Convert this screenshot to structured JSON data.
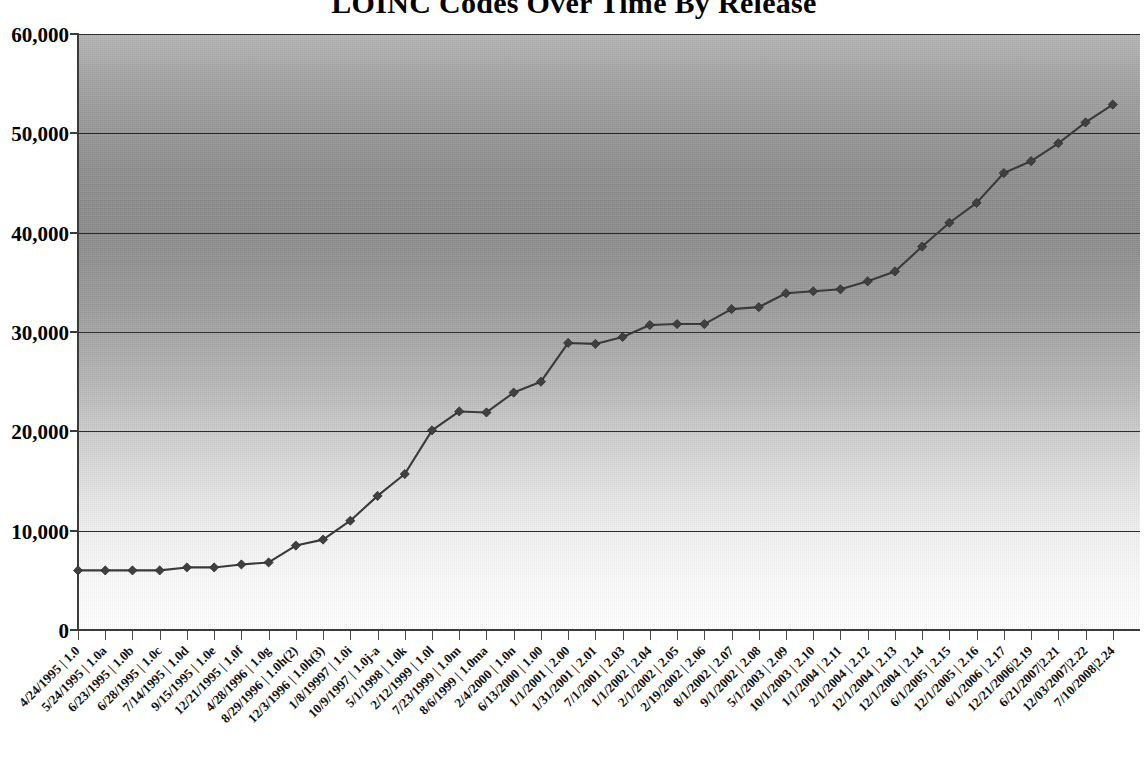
{
  "chart_data": {
    "type": "line",
    "title": "LOINC Codes Over Time By Release",
    "xlabel": "",
    "ylabel": "",
    "ylim": [
      0,
      60000
    ],
    "ytick_labels": [
      "0",
      "10,000",
      "20,000",
      "30,000",
      "40,000",
      "50,000",
      "60,000"
    ],
    "ytick_values": [
      0,
      10000,
      20000,
      30000,
      40000,
      50000,
      60000
    ],
    "grid": true,
    "legend": "none",
    "series_name": "LOINC Codes",
    "marker": "diamond",
    "line_color": "#3a3a3a",
    "marker_color": "#404040",
    "plot_gradient_top": "#8e8e8e",
    "plot_gradient_bottom": "#ffffff",
    "categories": [
      "4/24/1995 | 1.0",
      "5/24/1995 | 1.0a",
      "6/23/1995 | 1.0b",
      "6/28/1995 | 1.0c",
      "7/14/1995 | 1.0d",
      "9/15/1995 | 1.0e",
      "12/21/1995 | 1.0f",
      "4/28/1996 | 1.0g",
      "8/29/1996 | 1.0h(2)",
      "12/3/1996 | 1.0h(3)",
      "1/8/19997 | 1.0i",
      "10/9/1997 | 1.0j-a",
      "5/1/1998 | 1.0k",
      "2/12/1999 | 1.0l",
      "7/23/1999 | 1.0m",
      "8/6/1999 | 1.0ma",
      "2/4/2000 | 1.0n",
      "6/13/2000 | 1.00",
      "1/1/2001 | 2.00",
      "1/31/2001 | 2.01",
      "7/1/2001 | 2.03",
      "1/1/2002 | 2.04",
      "2/1/2002 | 2.05",
      "2/19/2002 | 2.06",
      "8/1/2002 | 2.07",
      "9/1/2002 | 2.08",
      "5/1/2003 | 2.09",
      "10/1/2003 | 2.10",
      "1/1/2004 | 2.11",
      "2/1/2004 | 2.12",
      "12/1/2004 | 2.13",
      "12/1/2004 | 2.14",
      "6/1/2005 | 2.15",
      "12/1/2005 | 2.16",
      "6/1/2006 | 2.17",
      "12/21/2006|2.19",
      "6/21/2007|2.21",
      "12/03/2007|2.22",
      "7/10/2008|2.24"
    ],
    "values": [
      6000,
      6000,
      6000,
      6000,
      6300,
      6300,
      6600,
      6800,
      8500,
      9100,
      11000,
      13500,
      15700,
      20100,
      22000,
      21900,
      23900,
      25000,
      28900,
      28800,
      29500,
      30700,
      30800,
      30800,
      32300,
      32500,
      33900,
      34100,
      34300,
      35100,
      36100,
      38600,
      41000,
      43000,
      46000,
      47200,
      49000,
      51100,
      52900
    ]
  },
  "x_axis_labels_raw": {
    "count": 39
  }
}
